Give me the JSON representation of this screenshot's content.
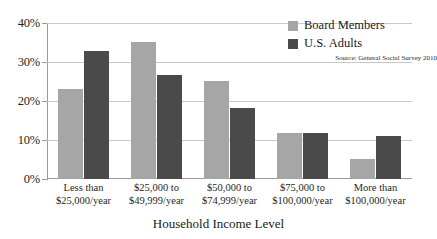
{
  "chart_data": {
    "type": "bar",
    "title": "",
    "xlabel": "Household Income Level",
    "ylabel": "",
    "ylim": [
      0,
      40
    ],
    "yticks": [
      "0%",
      "10%",
      "20%",
      "30%",
      "40%"
    ],
    "grid": true,
    "legend_position": "top-right",
    "categories": [
      "Less than\n$25,000/year",
      "$25,000 to\n$49,999/year",
      "$50,000 to\n$74,999/year",
      "$75,000 to\n$100,000/year",
      "More than\n$100,000/year"
    ],
    "category_lines": [
      [
        "Less than",
        "$25,000/year"
      ],
      [
        "$25,000 to",
        "$49,999/year"
      ],
      [
        "$50,000 to",
        "$74,999/year"
      ],
      [
        "$75,000 to",
        "$100,000/year"
      ],
      [
        "More than",
        "$100,000/year"
      ]
    ],
    "series": [
      {
        "name": "Board Members",
        "color": "#a6a6a6",
        "values": [
          23.1,
          35.1,
          25.1,
          11.8,
          5.1
        ]
      },
      {
        "name": "U.S. Adults",
        "color": "#4a4a4a",
        "values": [
          32.8,
          26.7,
          18.2,
          11.8,
          11.0
        ]
      }
    ],
    "annotations": [
      "Source: General Social Survey 2010"
    ]
  },
  "legend": {
    "entries": [
      {
        "label": "Board Members"
      },
      {
        "label": "U.S. Adults"
      }
    ],
    "source": "Source: General Social Survey 2010"
  },
  "axes": {
    "x_title": "Household Income Level"
  },
  "colors": {
    "series_board_members": "#a6a6a6",
    "series_us_adults": "#4a4a4a",
    "gridline": "#c9c9c9",
    "axis": "#9a9a9a",
    "text": "#1a1a1a",
    "background": "#ffffff"
  }
}
